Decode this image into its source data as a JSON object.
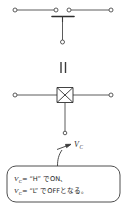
{
  "figure": {
    "name": "analog-switch-equivalence-diagram",
    "title": "",
    "colors": {
      "line": "#4a4a4a",
      "symbol": "#2e2e2e",
      "text": "#262626",
      "background": "#ffffff"
    }
  },
  "top_circuit": {
    "name": "mechanical-switch-symbol",
    "terminals": [
      {
        "id": "left-outer",
        "cx": 15,
        "cy": 10
      },
      {
        "id": "left-inner",
        "cx": 56,
        "cy": 10
      },
      {
        "id": "right-inner",
        "cx": 69,
        "cy": 10
      },
      {
        "id": "right-outer",
        "cx": 111,
        "cy": 10
      },
      {
        "id": "control-bottom",
        "cx": 62.5,
        "cy": 42
      }
    ],
    "contact_bar": {
      "x1": 53,
      "y1": 17,
      "x2": 73,
      "y2": 17
    },
    "control_stem": {
      "x": 62.5,
      "y1": 17,
      "y2": 42
    }
  },
  "equivalence": {
    "name": "equivalence-symbol",
    "glyph": "=",
    "meaning": "is equivalent to",
    "bars": [
      {
        "x": 61,
        "y1": 62,
        "y2": 73
      },
      {
        "x": 65.5,
        "y1": 62,
        "y2": 73
      }
    ]
  },
  "bottom_circuit": {
    "name": "analog-switch-bowtie-symbol",
    "terminals": [
      {
        "id": "left",
        "cx": 15,
        "cy": 95
      },
      {
        "id": "right",
        "cx": 111,
        "cy": 95
      },
      {
        "id": "control",
        "cx": 65,
        "cy": 133
      }
    ],
    "bowtie": {
      "cx": 65,
      "cy": 95,
      "half_width": 8,
      "half_height": 8
    },
    "control_stem": {
      "x": 65,
      "y1": 103,
      "y2": 133
    }
  },
  "control_label": {
    "name": "control-voltage-label",
    "base": "V",
    "subscript": "C",
    "full": "Vc",
    "x": 74,
    "y": 146
  },
  "arrow": {
    "name": "callout-arrow",
    "from": {
      "x": 58,
      "y": 150
    },
    "to": {
      "x": 71,
      "y": 145
    }
  },
  "callout": {
    "name": "explanation-callout",
    "box": {
      "x": 7,
      "y": 166,
      "width": 113,
      "height": 36,
      "radius": 9
    },
    "tail": {
      "x1": 62,
      "y1": 150,
      "x2": 58,
      "y2": 166
    },
    "lines": [
      {
        "id": "line-on",
        "var_base": "V",
        "var_sub": "C",
        "text": " = “H” でON、",
        "full": "Vс = “H”でON、"
      },
      {
        "id": "line-off",
        "var_base": "V",
        "var_sub": "C",
        "text": " = “L” でOFFとなる。",
        "full": "Vс = “L”でOFFとなる。"
      }
    ]
  }
}
